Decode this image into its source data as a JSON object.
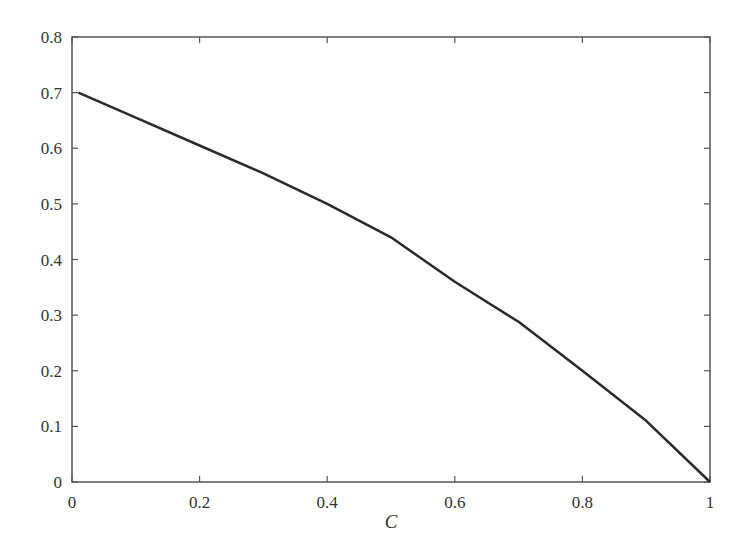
{
  "chart_data": {
    "type": "line",
    "title": "",
    "xlabel": "C",
    "ylabel": "",
    "xlim": [
      0,
      1
    ],
    "ylim": [
      0,
      0.8
    ],
    "grid": false,
    "legend": null,
    "x_ticks": [
      "0",
      "0.2",
      "0.4",
      "0.6",
      "0.8",
      "1"
    ],
    "y_ticks": [
      "0",
      "0.1",
      "0.2",
      "0.3",
      "0.4",
      "0.5",
      "0.6",
      "0.7",
      "0.8"
    ],
    "series": [
      {
        "name": "curve",
        "color": "#2a2a2a",
        "x": [
          0.01,
          0.1,
          0.2,
          0.3,
          0.4,
          0.5,
          0.6,
          0.7,
          0.8,
          0.9,
          1.0
        ],
        "y": [
          0.7,
          0.655,
          0.605,
          0.555,
          0.5,
          0.44,
          0.36,
          0.288,
          0.2,
          0.11,
          0.0
        ]
      }
    ]
  },
  "colors": {
    "axis": "#555555",
    "line": "#2a2a2a",
    "text": "#333333"
  }
}
